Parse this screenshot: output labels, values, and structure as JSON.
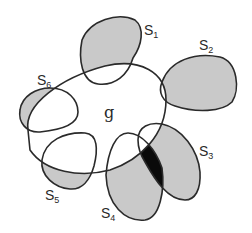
{
  "diagram": {
    "central_set": {
      "label": "g"
    },
    "satellite_sets": [
      {
        "id": "S1",
        "label": "S",
        "subscript": "1"
      },
      {
        "id": "S2",
        "label": "S",
        "subscript": "2"
      },
      {
        "id": "S3",
        "label": "S",
        "subscript": "3"
      },
      {
        "id": "S4",
        "label": "S",
        "subscript": "4"
      },
      {
        "id": "S5",
        "label": "S",
        "subscript": "5"
      },
      {
        "id": "S6",
        "label": "S",
        "subscript": "6"
      }
    ],
    "colors": {
      "outline": "#2a2a2a",
      "shade": "#c9c9c9",
      "overlap": "#0a0a0a",
      "background": "#ffffff"
    }
  }
}
